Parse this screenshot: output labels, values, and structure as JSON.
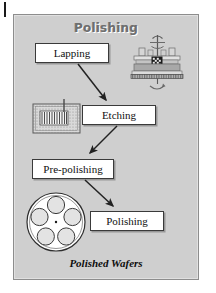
{
  "diagram": {
    "title": "Polishing",
    "caption": "Polished Wafers",
    "type": "process-flowchart",
    "frame": {
      "background_color": "#cfcfcf",
      "border_color": "#8d8d8d"
    },
    "colors": {
      "box_fill": "#ffffff",
      "box_border": "#3a3a3a",
      "arrow": "#2b2b2b",
      "title_text": "#6f6f6f",
      "caption_text": "#0d0d0d"
    },
    "steps": [
      {
        "id": "lapping",
        "label": "Lapping"
      },
      {
        "id": "etching",
        "label": "Etching"
      },
      {
        "id": "pre-polishing",
        "label": "Pre-polishing"
      },
      {
        "id": "polishing",
        "label": "Polishing"
      }
    ],
    "flow": [
      {
        "from": "Lapping",
        "to": "Etching"
      },
      {
        "from": "Etching",
        "to": "Pre-polishing"
      },
      {
        "from": "Pre-polishing",
        "to": "Polishing"
      }
    ],
    "illustrations": [
      {
        "id": "lapping-machine",
        "name": "lapping-machine-illustration",
        "associated_step": "Lapping"
      },
      {
        "id": "etching-bath",
        "name": "etching-bath-illustration",
        "associated_step": "Etching"
      },
      {
        "id": "wafer-carrier",
        "name": "wafer-carrier-illustration",
        "associated_step": "Polishing",
        "wafer_pocket_count": 5
      }
    ],
    "registration_mark": "crop-tick"
  }
}
